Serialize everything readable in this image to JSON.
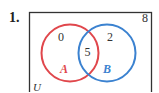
{
  "problem": {
    "number_label": "1."
  },
  "venn": {
    "universe_label": "U",
    "outside_count": "8",
    "sets": [
      {
        "label": "A",
        "color": "#e0474c",
        "only_count": "0"
      },
      {
        "label": "B",
        "color": "#3b82d0",
        "only_count": "2"
      }
    ],
    "intersection_count": "5",
    "box_color": "#333333"
  }
}
